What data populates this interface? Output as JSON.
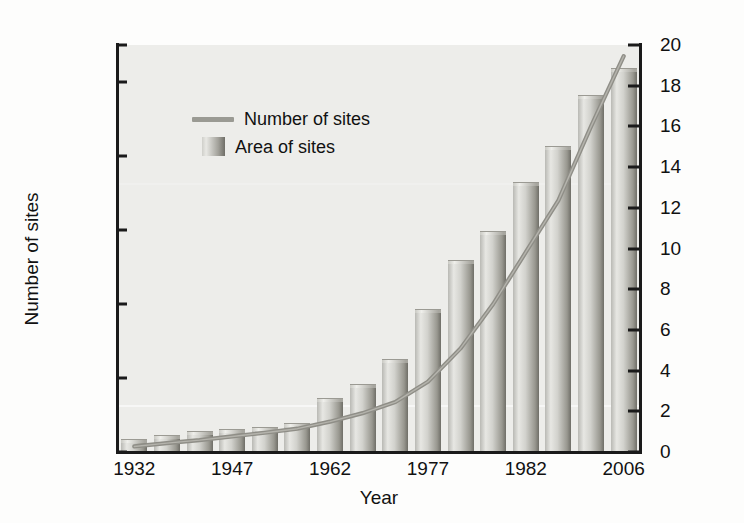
{
  "chart_data": {
    "type": "bar",
    "title": "",
    "xlabel": "Year",
    "ylabel": "Number of sites",
    "y2label": "Area (millions of km²)",
    "grid": false,
    "legend_position": "upper-left-inside",
    "ylim": [
      0,
      110000
    ],
    "y2lim": [
      0,
      20
    ],
    "xticklabels": [
      "1932",
      "1947",
      "1962",
      "1977",
      "1982",
      "2006"
    ],
    "xtick_positions": [
      0,
      3,
      6,
      9,
      12,
      15
    ],
    "left_axis_ticks": [
      "0",
      "20,000",
      "40,000",
      "60,000",
      "80,000",
      "100,000",
      "110,000"
    ],
    "left_axis_tick_values": [
      0,
      20000,
      40000,
      60000,
      80000,
      100000,
      110000
    ],
    "right_axis_ticks": [
      "0",
      "2",
      "4",
      "6",
      "8",
      "10",
      "12",
      "14",
      "16",
      "18",
      "20"
    ],
    "right_axis_tick_values": [
      0,
      2,
      4,
      6,
      8,
      10,
      12,
      14,
      16,
      18,
      20
    ],
    "categories": [
      "1932",
      "1937",
      "1942",
      "1947",
      "1952",
      "1957",
      "1962",
      "1967",
      "1972",
      "1977",
      "1982",
      "1987",
      "1992",
      "1997",
      "2002",
      "2006"
    ],
    "series": [
      {
        "name": "Area of sites",
        "type": "bar",
        "axis": "right",
        "unit": "millions of km²",
        "values": [
          0.6,
          0.8,
          1.0,
          1.1,
          1.2,
          1.4,
          2.6,
          3.3,
          4.5,
          7.0,
          9.4,
          10.8,
          13.2,
          15.0,
          17.5,
          18.8
        ]
      },
      {
        "name": "Number of sites",
        "type": "line",
        "axis": "left",
        "unit": "sites",
        "values": [
          1500,
          2400,
          3200,
          4200,
          5200,
          6300,
          8200,
          10500,
          13500,
          19000,
          28000,
          40000,
          54000,
          68000,
          88000,
          107000
        ]
      }
    ],
    "colors": {
      "plot_background": "#ededea",
      "bar_light": "#e7e7e3",
      "bar_dark": "#6f6e67",
      "line": "#8f8e87",
      "axis": "#1a1a1a",
      "text": "#111111"
    }
  },
  "legend": {
    "items": [
      {
        "label": "Number of sites",
        "marker": "line"
      },
      {
        "label": "Area of sites",
        "marker": "bar-swatch"
      }
    ]
  },
  "axes": {
    "x_title": "Year",
    "y_left_title": "Number of sites",
    "y_right_title_prefix": "Area (millions of km",
    "y_right_title_sup": "2",
    "y_right_title_suffix": ")"
  }
}
